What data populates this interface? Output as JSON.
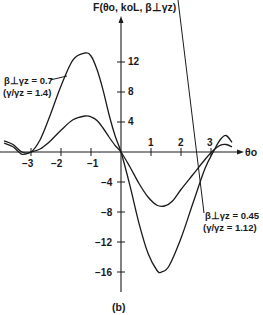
{
  "chart_data": {
    "type": "line",
    "title": "F(θo, koL, β⊥γz)",
    "xlabel": "θo",
    "ylabel": "F(θo, koL, β⊥γz)",
    "caption": "(b)",
    "xlim": [
      -3.7,
      3.7
    ],
    "ylim": [
      -18,
      16
    ],
    "x_ticks": [
      -3,
      -2,
      -1,
      1,
      2,
      3
    ],
    "y_ticks": [
      12,
      8,
      4,
      -4,
      -8,
      -12,
      -16
    ],
    "grid": false,
    "legend": "inline annotations",
    "series": [
      {
        "name": "β⊥γz = 0.7 (γ/γz = 1.4)",
        "label_line1": "β⊥γz = 0.7",
        "label_line2": "(γ/γz = 1.4)",
        "x": [
          -3.9,
          -3.6,
          -3.3,
          -3.0,
          -2.7,
          -2.4,
          -2.0,
          -1.6,
          -1.2,
          -1.0,
          -0.8,
          -0.6,
          -0.4,
          -0.2,
          0.0,
          0.3,
          0.6,
          0.9,
          1.2,
          1.35,
          1.6,
          2.0,
          2.4,
          2.8,
          3.1,
          3.3,
          3.5,
          3.7
        ],
        "values": [
          1.5,
          1.0,
          0.0,
          0.0,
          1.6,
          4.5,
          8.8,
          12.3,
          13.2,
          12.8,
          11.0,
          8.3,
          5.0,
          2.2,
          0.0,
          -4.5,
          -9.5,
          -13.5,
          -15.8,
          -16.0,
          -15.2,
          -11.5,
          -6.8,
          -2.2,
          0.2,
          1.6,
          2.2,
          1.3
        ]
      },
      {
        "name": "β⊥γz = 0.45 (γ/γz = 1.12)",
        "label_line1": "β⊥γz = 0.45",
        "label_line2": "(γ/γz = 1.12)",
        "x": [
          -3.9,
          -3.6,
          -3.3,
          -3.0,
          -2.7,
          -2.4,
          -2.0,
          -1.6,
          -1.2,
          -1.0,
          -0.8,
          -0.6,
          -0.4,
          -0.2,
          0.0,
          0.3,
          0.6,
          0.9,
          1.2,
          1.45,
          1.7,
          2.0,
          2.4,
          2.8,
          3.1,
          3.3,
          3.5,
          3.7
        ],
        "values": [
          1.2,
          0.7,
          -0.3,
          0.0,
          0.4,
          1.3,
          2.9,
          4.3,
          4.8,
          4.7,
          4.2,
          3.2,
          2.0,
          0.9,
          0.0,
          -2.0,
          -4.2,
          -6.0,
          -7.1,
          -7.2,
          -6.6,
          -5.0,
          -3.0,
          -1.0,
          0.3,
          0.9,
          1.0,
          0.7
        ]
      }
    ]
  },
  "labels": {
    "y_axis_title": "F(θo, koL, β⊥γz)",
    "x_axis_title": "θo",
    "caption": "(b)",
    "x_tick_labels": [
      "−3",
      "−2",
      "−1",
      "1",
      "2",
      "3"
    ],
    "y_tick_labels": [
      "12",
      "8",
      "4",
      "−4",
      "−8",
      "−12",
      "−16"
    ],
    "series0_line1": "β⊥γz = 0.7",
    "series0_line2": "(γ/γz = 1.4)",
    "series1_line1": "β⊥γz = 0.45",
    "series1_line2": "(γ/γz = 1.12)"
  },
  "colors": {
    "ink": "#1a1a1a",
    "background": "#ffffff"
  }
}
